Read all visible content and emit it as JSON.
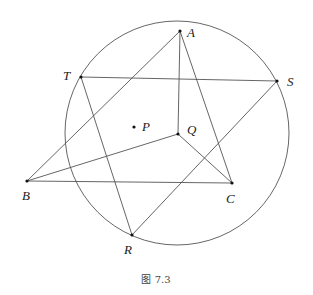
{
  "figure": {
    "caption": "图 7.3",
    "circle": {
      "cx": 177,
      "cy": 133,
      "r": 112
    },
    "points": {
      "A": {
        "x": 180,
        "y": 31,
        "label": "A",
        "lx": 187,
        "ly": 37
      },
      "T": {
        "x": 81,
        "y": 77,
        "label": "T",
        "lx": 63,
        "ly": 80
      },
      "S": {
        "x": 277,
        "y": 81,
        "label": "S",
        "lx": 287,
        "ly": 86
      },
      "P": {
        "x": 134,
        "y": 127,
        "label": "P",
        "lx": 142,
        "ly": 131
      },
      "Q": {
        "x": 178,
        "y": 134,
        "label": "Q",
        "lx": 187,
        "ly": 134
      },
      "B": {
        "x": 27,
        "y": 181,
        "label": "B",
        "lx": 22,
        "ly": 200
      },
      "C": {
        "x": 232,
        "y": 183,
        "label": "C",
        "lx": 226,
        "ly": 203
      },
      "R": {
        "x": 132,
        "y": 235,
        "label": "R",
        "lx": 124,
        "ly": 254
      }
    },
    "segments": [
      [
        "A",
        "B"
      ],
      [
        "A",
        "C"
      ],
      [
        "A",
        "Q"
      ],
      [
        "B",
        "Q"
      ],
      [
        "Q",
        "C"
      ],
      [
        "B",
        "C"
      ],
      [
        "T",
        "S"
      ],
      [
        "T",
        "R"
      ],
      [
        "R",
        "S"
      ]
    ],
    "colors": {
      "line": "#555555",
      "point": "#111111"
    }
  }
}
